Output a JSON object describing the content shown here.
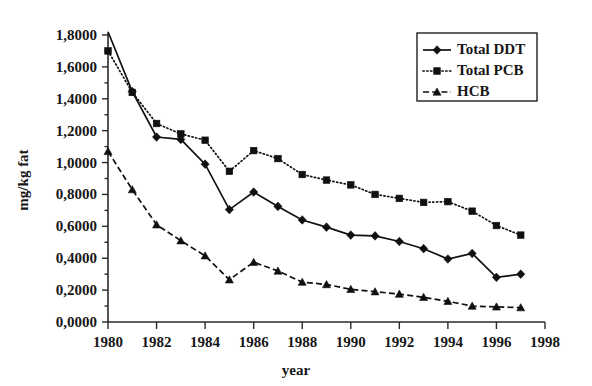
{
  "chart_data": {
    "type": "line",
    "title": "",
    "xlabel": "year",
    "ylabel": "mg/kg fat",
    "xlim": [
      1980,
      1998
    ],
    "ylim": [
      0.0,
      1.8
    ],
    "grid": false,
    "legend_position": "top-right",
    "x": [
      1980,
      1981,
      1982,
      1983,
      1984,
      1985,
      1986,
      1987,
      1988,
      1989,
      1990,
      1991,
      1992,
      1993,
      1994,
      1995,
      1996,
      1997
    ],
    "xticks": [
      "1980",
      "1982",
      "1984",
      "1986",
      "1988",
      "1990",
      "1992",
      "1994",
      "1996",
      "1998"
    ],
    "xtick_values": [
      1980,
      1982,
      1984,
      1986,
      1988,
      1990,
      1992,
      1994,
      1996,
      1998
    ],
    "yticks": [
      "0,0000",
      "0,2000",
      "0,4000",
      "0,6000",
      "0,8000",
      "1,0000",
      "1,2000",
      "1,4000",
      "1,6000",
      "1,8000"
    ],
    "ytick_values": [
      0.0,
      0.2,
      0.4,
      0.6,
      0.8,
      1.0,
      1.2,
      1.4,
      1.6,
      1.8
    ],
    "series": [
      {
        "name": "Total DDT",
        "marker": "diamond",
        "linestyle": "solid",
        "values": [
          1.82,
          1.445,
          1.16,
          1.145,
          0.99,
          0.705,
          0.815,
          0.725,
          0.64,
          0.595,
          0.545,
          0.54,
          0.505,
          0.46,
          0.395,
          0.43,
          0.28,
          0.3
        ]
      },
      {
        "name": "Total PCB",
        "marker": "square",
        "linestyle": "dotted",
        "values": [
          1.7,
          1.44,
          1.245,
          1.18,
          1.14,
          0.945,
          1.075,
          1.025,
          0.925,
          0.89,
          0.86,
          0.8,
          0.775,
          0.75,
          0.755,
          0.695,
          0.605,
          0.545
        ]
      },
      {
        "name": "HCB",
        "marker": "triangle",
        "linestyle": "dashed",
        "values": [
          1.07,
          0.83,
          0.61,
          0.51,
          0.415,
          0.265,
          0.375,
          0.32,
          0.25,
          0.235,
          0.205,
          0.19,
          0.175,
          0.155,
          0.13,
          0.1,
          0.095,
          0.09
        ]
      }
    ]
  },
  "legend": {
    "items": [
      {
        "label": "Total DDT"
      },
      {
        "label": "Total PCB"
      },
      {
        "label": "HCB"
      }
    ]
  },
  "colors": {
    "ink": "#111111",
    "background": "#ffffff"
  }
}
